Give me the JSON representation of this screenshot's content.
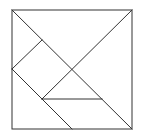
{
  "diagram": {
    "type": "tangram",
    "stroke_color": "#333333",
    "background": "#ffffff",
    "outer_square": {
      "x1": 12,
      "y1": 10,
      "x2": 132,
      "y2": 129
    },
    "pieces": [
      {
        "name": "large-triangle-top",
        "points": "12,10 132,10 72,69"
      },
      {
        "name": "large-triangle-right",
        "points": "132,10 132,129 72,69"
      },
      {
        "name": "small-triangle-top-left",
        "points": "12,10 42,40 12,69"
      },
      {
        "name": "square",
        "points": "12,69 42,40 72,69 42,99"
      },
      {
        "name": "small-triangle-middle",
        "points": "72,69 102,99 42,99"
      },
      {
        "name": "medium-triangle-bottom-right",
        "points": "42,99 102,99 132,129 72,129"
      },
      {
        "name": "parallelogram-bottom-left",
        "points": "12,69 42,99 72,129 12,129"
      }
    ],
    "lines": [
      {
        "name": "main-diagonal",
        "x1": 12,
        "y1": 10,
        "x2": 132,
        "y2": 129
      },
      {
        "name": "anti-diagonal-upper",
        "x1": 132,
        "y1": 10,
        "x2": 42,
        "y2": 99
      },
      {
        "name": "square-upper-edge",
        "x1": 42,
        "y1": 40,
        "x2": 12,
        "y2": 69
      },
      {
        "name": "left-lower-diagonal",
        "x1": 12,
        "y1": 69,
        "x2": 72,
        "y2": 129
      },
      {
        "name": "horizontal-divider",
        "x1": 42,
        "y1": 99,
        "x2": 102,
        "y2": 99
      }
    ]
  }
}
